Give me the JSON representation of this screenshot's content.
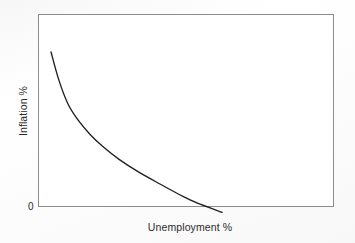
{
  "chart_data": {
    "type": "line",
    "title": "",
    "xlabel": "Unemployment %",
    "ylabel": "Inflation %",
    "origin_label": "0",
    "grid": false,
    "legend": null,
    "axis_ticks": {
      "x": [],
      "y": [
        "0"
      ]
    },
    "xlim": [
      0,
      10
    ],
    "ylim": [
      0,
      10
    ],
    "series": [
      {
        "name": "Phillips curve",
        "color": "#1f1f1f",
        "comment": "Downward-sloping convex curve: high inflation at low unemployment, falling toward and below zero as unemployment rises",
        "x": [
          0.44,
          0.7,
          1.01,
          1.35,
          1.76,
          2.22,
          2.74,
          3.38,
          4.12,
          4.93,
          5.37,
          6.22
        ],
        "y": [
          8.03,
          6.6,
          5.35,
          4.51,
          3.76,
          3.09,
          2.47,
          1.83,
          1.19,
          0.52,
          0.21,
          -0.28
        ]
      }
    ]
  },
  "figure": {
    "xlabel": "Unemployment %",
    "ylabel": "Inflation %",
    "origin": "0"
  },
  "style": {
    "frame_color": "#8c8c8c",
    "curve_color": "#1f1f1f",
    "background": "#ffffff",
    "text_color": "#2b2b2b"
  }
}
